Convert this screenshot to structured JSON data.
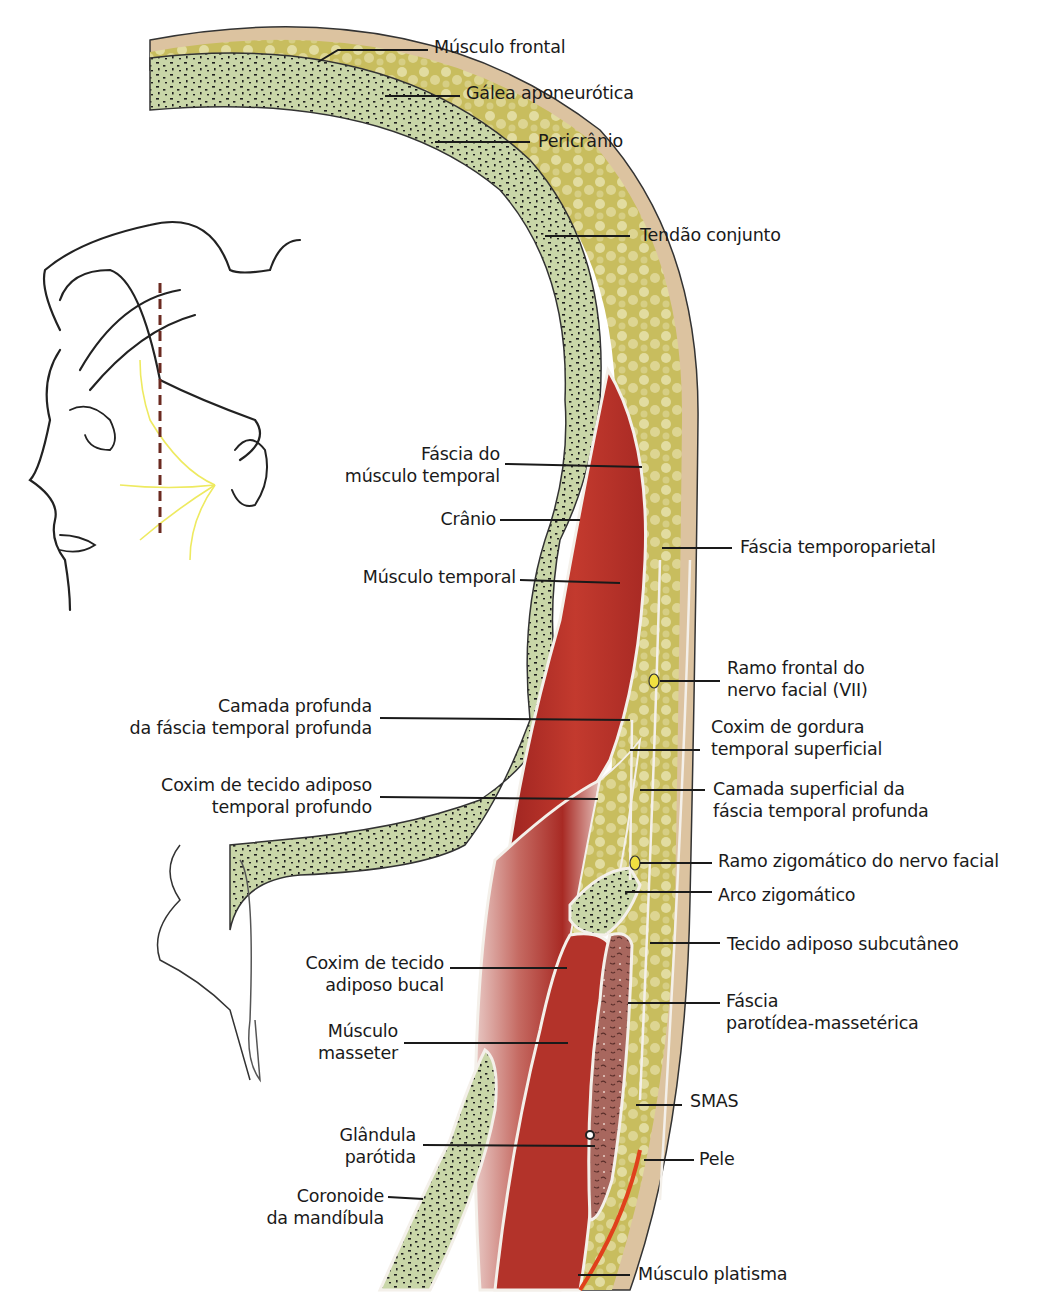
{
  "figure": {
    "colors": {
      "bone": "#c9d6a8",
      "bone_dots": "#1e1e1e",
      "fat": "#cfc56a",
      "muscle": "#b8302a",
      "skin": "#dcc3a0",
      "parotid": "#a0605a",
      "nerve": "#f0e040",
      "platysma": "#e0401c",
      "fascia": "#f2efe8",
      "leader_line": "#1a1a1a"
    },
    "inset": {
      "description": "Profile sketch of head with facial nerve branches and vertical dashed section line",
      "section_line_color": "#6b2a20",
      "nerve_color": "#eeea60"
    }
  },
  "labels": {
    "musculo_frontal": [
      "Músculo frontal"
    ],
    "galea": [
      "Gálea aponeurótica"
    ],
    "pericranio": [
      "Pericrânio"
    ],
    "tendao": [
      "Tendão conjunto"
    ],
    "fascia_musculo_temporal": [
      "Fáscia do",
      "músculo temporal"
    ],
    "cranio": [
      "Crânio"
    ],
    "fascia_temporoparietal": [
      "Fáscia temporoparietal"
    ],
    "musculo_temporal": [
      "Músculo temporal"
    ],
    "ramo_frontal": [
      "Ramo frontal do",
      "nervo facial (VII)"
    ],
    "camada_profunda": [
      "Camada profunda",
      "da fáscia temporal profunda"
    ],
    "coxim_gordura_superficial": [
      "Coxim de gordura",
      "temporal superficial"
    ],
    "coxim_adiposo_profundo": [
      "Coxim de tecido adiposo",
      "temporal profundo"
    ],
    "camada_superficial": [
      "Camada superficial da",
      "fáscia temporal profunda"
    ],
    "ramo_zigomatico": [
      "Ramo zigomático do nervo facial"
    ],
    "arco_zigomatico": [
      "Arco zigomático"
    ],
    "tecido_subcutaneo": [
      "Tecido adiposo subcutâneo"
    ],
    "coxim_bucal": [
      "Coxim de tecido",
      "adiposo bucal"
    ],
    "fascia_parotidea": [
      "Fáscia",
      "parotídea-massetérica"
    ],
    "masseter": [
      "Músculo",
      "masseter"
    ],
    "smas": [
      "SMAS"
    ],
    "glandula_parotida": [
      "Glândula",
      "parótida"
    ],
    "pele": [
      "Pele"
    ],
    "coronoide": [
      "Coronoide",
      "da mandíbula"
    ],
    "platisma": [
      "Músculo platisma"
    ]
  }
}
